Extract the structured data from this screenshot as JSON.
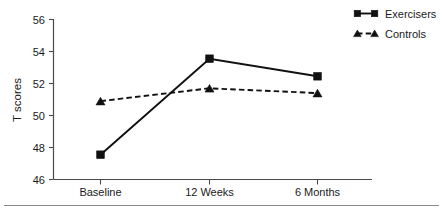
{
  "chart_data": {
    "type": "line",
    "title": "",
    "subtitle": "",
    "xlabel": "",
    "ylabel": "T scores",
    "categories": [
      "Baseline",
      "12 Weeks",
      "6 Months"
    ],
    "series": [
      {
        "name": "Exercisers",
        "values": [
          47.55,
          53.55,
          52.45
        ],
        "marker": "square",
        "linestyle": "solid"
      },
      {
        "name": "Controls",
        "values": [
          50.9,
          51.7,
          51.4
        ],
        "marker": "triangle",
        "linestyle": "dashed"
      }
    ],
    "ylim": [
      46,
      56
    ],
    "yticks": [
      46,
      48,
      50,
      52,
      54,
      56
    ],
    "ytick_labels": [
      "46",
      "48",
      "50",
      "52",
      "54",
      "56"
    ],
    "xlim": [
      0,
      2
    ],
    "grid": false,
    "legend_position": "top-right",
    "legend_entries": [
      "Exercisers",
      "Controls"
    ],
    "colors": {
      "series": "#111111",
      "axis": "#4a4a4a",
      "text": "#1a1a1a",
      "background": "#ffffff"
    }
  },
  "axes": {
    "y_title": "T scores",
    "y_tick_0": "46",
    "y_tick_1": "48",
    "y_tick_2": "50",
    "y_tick_3": "52",
    "y_tick_4": "54",
    "y_tick_5": "56",
    "x_tick_0": "Baseline",
    "x_tick_1": "12 Weeks",
    "x_tick_2": "6 Months"
  },
  "legend": {
    "entry_0_label": "Exercisers",
    "entry_1_label": "Controls"
  }
}
